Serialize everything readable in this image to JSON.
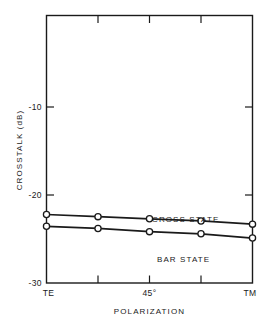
{
  "chart_data": {
    "type": "line",
    "title": "",
    "xlabel": "POLARIZATION",
    "ylabel": "CROSSTALK (dB)",
    "ylim": [
      -30,
      -5
    ],
    "xlim": [
      0,
      4
    ],
    "grid": false,
    "legend_position": "inline-annotation",
    "y_ticks": [
      -10,
      -20,
      -30
    ],
    "y_tick_labels": [
      "-10",
      "-20",
      "-30"
    ],
    "x_tick_labels": [
      "TE",
      "45°",
      "TM"
    ],
    "x_tick_label_positions": [
      0,
      2,
      4
    ],
    "x_minor_tick_positions": [
      1,
      2,
      3
    ],
    "x_categories": [
      "TE",
      "",
      "45°",
      "",
      "TM"
    ],
    "series": [
      {
        "name": "CROSS STATE",
        "label": "CROSS STATE",
        "marker": "open-circle",
        "x": [
          0,
          1,
          2,
          3,
          4
        ],
        "values": [
          -23.6,
          -23.8,
          -24.0,
          -24.2,
          -24.5
        ]
      },
      {
        "name": "BAR STATE",
        "label": "BAR STATE",
        "marker": "open-circle",
        "x": [
          0,
          1,
          2,
          3,
          4
        ],
        "values": [
          -24.7,
          -24.9,
          -25.2,
          -25.4,
          -25.8
        ]
      }
    ],
    "colors": {
      "line": "#1a1a1a",
      "marker_fill": "#ffffff",
      "axis": "#1a1a1a",
      "background": "#ffffff"
    }
  },
  "annotations": {
    "cross_state_label": "CROSS STATE",
    "bar_state_label": "BAR STATE"
  }
}
